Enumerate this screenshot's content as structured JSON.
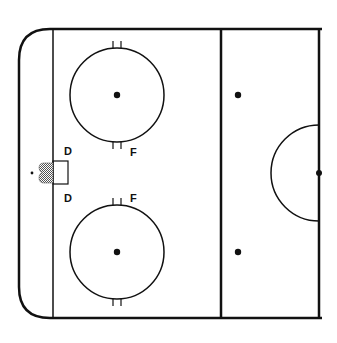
{
  "diagram": {
    "type": "hockey-rink-half",
    "colors": {
      "line": "#111111",
      "background": "#ffffff",
      "net_fill": "#9a9a9a"
    },
    "labels": {
      "top_d": "D",
      "bottom_d": "D",
      "top_f": "F",
      "bottom_f": "F"
    },
    "elements": [
      {
        "name": "boards",
        "description": "Rink outline with rounded left corners"
      },
      {
        "name": "goal-line",
        "x": 53
      },
      {
        "name": "blue-line",
        "x": 221
      },
      {
        "name": "center-line",
        "x": 319
      },
      {
        "name": "faceoff-circle-top",
        "cx": 117,
        "cy": 95,
        "r": 47
      },
      {
        "name": "faceoff-circle-bottom",
        "cx": 117,
        "cy": 252,
        "r": 47
      },
      {
        "name": "neutral-dot-top",
        "cx": 238,
        "cy": 95
      },
      {
        "name": "neutral-dot-bottom",
        "cx": 238,
        "cy": 252
      },
      {
        "name": "center-circle-half",
        "cx": 319,
        "cy": 173,
        "r": 48
      },
      {
        "name": "center-dot",
        "cx": 319,
        "cy": 173
      },
      {
        "name": "goal-net",
        "x": 40,
        "y": 163
      },
      {
        "name": "goal-crease-box",
        "x": 53,
        "y": 161,
        "w": 15,
        "h": 23
      }
    ]
  }
}
